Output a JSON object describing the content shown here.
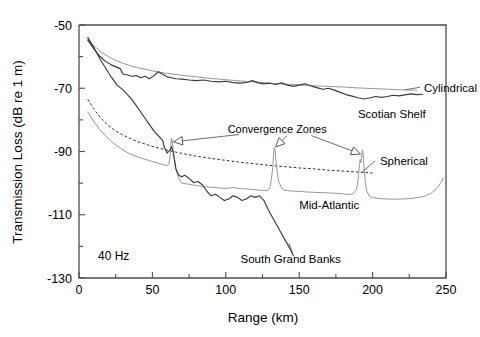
{
  "figure": {
    "frequency_label": "40 Hz"
  },
  "chart_data": {
    "type": "line",
    "title": "",
    "xlabel": "Range (km)",
    "ylabel": "Transmission Loss (dB re 1 m)",
    "xlim": [
      0,
      250
    ],
    "ylim": [
      -130,
      -50
    ],
    "xticks": [
      0,
      25,
      50,
      75,
      100,
      125,
      150,
      175,
      200,
      225,
      250
    ],
    "xtick_labels": [
      "0",
      "",
      "50",
      "",
      "100",
      "",
      "150",
      "",
      "200",
      "",
      "250"
    ],
    "yticks": [
      -130,
      -120,
      -110,
      -100,
      -90,
      -80,
      -70,
      -60,
      -50
    ],
    "ytick_labels": [
      "-130",
      "",
      "-110",
      "",
      "-90",
      "",
      "-70",
      "",
      "-50"
    ],
    "grid": false,
    "legend": "inline-annotations",
    "annotations": [
      {
        "text": "Convergence Zones",
        "x": 135,
        "y": -84,
        "points_to": [
          [
            63,
            -87
          ],
          [
            133,
            -89
          ],
          [
            193,
            -91
          ]
        ]
      },
      {
        "text": "40 Hz",
        "x": 18,
        "y": -124
      }
    ],
    "series": [
      {
        "name": "Cylindrical",
        "label": "Cylindrical",
        "style": "solid-thin",
        "color": "#8a8a8a",
        "label_x": 235,
        "label_y": -70,
        "x": [
          6,
          10,
          15,
          20,
          25,
          30,
          35,
          40,
          50,
          60,
          70,
          80,
          90,
          100,
          110,
          120,
          130,
          140,
          150,
          160,
          170,
          180,
          190,
          200,
          210,
          220,
          230
        ],
        "y": [
          -54.5,
          -56.5,
          -58.5,
          -60.0,
          -61.2,
          -62.1,
          -62.9,
          -63.5,
          -64.5,
          -65.3,
          -65.9,
          -66.4,
          -66.9,
          -67.3,
          -67.7,
          -68.0,
          -68.4,
          -68.7,
          -68.9,
          -69.2,
          -69.4,
          -69.6,
          -69.9,
          -70.1,
          -70.3,
          -70.5,
          -70.6
        ]
      },
      {
        "name": "Scotian Shelf",
        "label": "Scotian Shelf",
        "style": "solid-medium",
        "color": "#3a3a3a",
        "label_x": 190,
        "label_y": -78,
        "x": [
          6,
          10,
          14,
          18,
          22,
          26,
          28,
          30,
          33,
          36,
          39,
          42,
          45,
          48,
          51,
          54,
          57,
          60,
          63,
          66,
          70,
          75,
          80,
          85,
          90,
          95,
          100,
          105,
          110,
          115,
          118,
          122,
          126,
          130,
          134,
          138,
          142,
          146,
          150,
          154,
          158,
          162,
          166,
          170,
          174,
          178,
          182,
          186,
          190,
          194,
          198,
          202,
          206,
          210,
          214,
          218,
          222,
          226,
          230,
          234
        ],
        "y": [
          -54.8,
          -57.5,
          -59.8,
          -61.5,
          -62.6,
          -63.4,
          -63.8,
          -65.5,
          -65.8,
          -66.2,
          -66.0,
          -66.7,
          -66.2,
          -67.0,
          -66.0,
          -64.8,
          -65.6,
          -66.4,
          -66.7,
          -67.0,
          -67.1,
          -67.4,
          -67.6,
          -67.4,
          -67.8,
          -68.0,
          -67.8,
          -68.2,
          -68.4,
          -68.1,
          -67.6,
          -68.3,
          -68.6,
          -68.4,
          -68.8,
          -68.3,
          -69.0,
          -69.4,
          -69.0,
          -68.6,
          -69.3,
          -69.8,
          -70.3,
          -70.0,
          -70.6,
          -71.3,
          -72.0,
          -72.5,
          -73.0,
          -73.4,
          -73.1,
          -72.6,
          -72.9,
          -72.6,
          -72.2,
          -72.4,
          -72.1,
          -71.8,
          -72.0,
          -71.9
        ]
      },
      {
        "name": "Spherical",
        "label": "Spherical",
        "style": "dashed",
        "color": "#2b2b2b",
        "label_x": 205,
        "label_y": -93,
        "x": [
          6,
          10,
          15,
          20,
          25,
          30,
          35,
          40,
          50,
          60,
          70,
          80,
          90,
          100,
          110,
          120,
          130,
          140,
          150,
          160,
          170,
          180,
          190,
          200
        ],
        "y": [
          -73.5,
          -76.5,
          -79.5,
          -81.8,
          -83.5,
          -84.8,
          -85.9,
          -86.9,
          -88.4,
          -89.6,
          -90.6,
          -91.5,
          -92.2,
          -92.8,
          -93.4,
          -93.9,
          -94.4,
          -94.8,
          -95.2,
          -95.5,
          -95.9,
          -96.2,
          -96.5,
          -96.8
        ]
      },
      {
        "name": "Mid-Atlantic",
        "label": "Mid-Atlantic",
        "style": "solid-thin",
        "color": "#8a8a8a",
        "label_x": 150,
        "label_y": -107,
        "comment": "convergence-zone spikes at 63, 133 and 193 km",
        "x": [
          6,
          10,
          14,
          18,
          22,
          26,
          30,
          34,
          38,
          42,
          46,
          50,
          54,
          58,
          60,
          61,
          62,
          62.5,
          63,
          63.5,
          64,
          65,
          66,
          68,
          70,
          74,
          78,
          82,
          86,
          90,
          95,
          100,
          105,
          110,
          115,
          120,
          125,
          128,
          130,
          131,
          132,
          132.5,
          133,
          133.5,
          134,
          135,
          136,
          138,
          140,
          145,
          150,
          155,
          160,
          165,
          170,
          175,
          180,
          184,
          187,
          189,
          190,
          190.5,
          191,
          191.5,
          192,
          192.5,
          193,
          193.5,
          194,
          195,
          196,
          198,
          200,
          205,
          210,
          215,
          220,
          225,
          230,
          235,
          240,
          245,
          248
        ],
        "y": [
          -77.5,
          -80.5,
          -83.0,
          -85.0,
          -86.8,
          -88.2,
          -89.5,
          -90.6,
          -91.4,
          -92.0,
          -92.6,
          -93.2,
          -93.7,
          -94.2,
          -94.5,
          -94.0,
          -92.0,
          -88.5,
          -85.8,
          -86.5,
          -89.0,
          -92.5,
          -95.5,
          -98.5,
          -100.0,
          -100.3,
          -100.6,
          -100.9,
          -101.1,
          -101.3,
          -101.5,
          -101.7,
          -101.4,
          -101.7,
          -101.9,
          -102.1,
          -102.3,
          -102.4,
          -101.5,
          -99.0,
          -95.0,
          -91.5,
          -88.8,
          -89.5,
          -92.0,
          -96.5,
          -99.5,
          -101.5,
          -102.3,
          -102.5,
          -102.6,
          -102.8,
          -102.9,
          -103.0,
          -103.1,
          -103.2,
          -103.4,
          -103.6,
          -103.3,
          -102.0,
          -99.5,
          -97.0,
          -94.5,
          -92.5,
          -93.5,
          -91.8,
          -89.5,
          -90.5,
          -94.0,
          -99.5,
          -102.5,
          -104.2,
          -104.6,
          -104.9,
          -105.0,
          -105.1,
          -105.0,
          -104.9,
          -104.6,
          -104.2,
          -103.2,
          -101.0,
          -98.5
        ]
      },
      {
        "name": "South Grand Banks",
        "label": "South Grand Banks",
        "style": "solid-medium",
        "color": "#3a3a3a",
        "label_x": 110,
        "label_y": -124,
        "x": [
          6,
          10,
          14,
          18,
          22,
          26,
          30,
          33,
          36,
          39,
          42,
          45,
          48,
          51,
          54,
          57,
          58,
          60,
          62,
          63,
          64,
          65,
          66,
          68,
          70,
          72,
          75,
          78,
          81,
          84,
          87,
          90,
          93,
          96,
          99,
          102,
          105,
          108,
          111,
          114,
          117,
          120,
          123,
          126,
          129,
          132,
          135,
          138,
          141,
          144,
          146
        ],
        "y": [
          -54.0,
          -57.0,
          -60.5,
          -63.5,
          -66.5,
          -69.0,
          -70.5,
          -72.0,
          -73.5,
          -75.5,
          -77.5,
          -79.5,
          -81.5,
          -83.5,
          -85.0,
          -86.5,
          -88.5,
          -90.5,
          -89.5,
          -88.5,
          -90.0,
          -92.5,
          -95.5,
          -97.5,
          -98.0,
          -97.5,
          -98.5,
          -99.8,
          -99.5,
          -100.5,
          -102.5,
          -104.0,
          -103.5,
          -104.5,
          -105.5,
          -105.0,
          -104.0,
          -104.5,
          -105.5,
          -105.0,
          -104.0,
          -104.5,
          -104.0,
          -105.5,
          -108.5,
          -111.0,
          -113.5,
          -116.0,
          -118.5,
          -121.0,
          -123.0
        ]
      }
    ]
  }
}
